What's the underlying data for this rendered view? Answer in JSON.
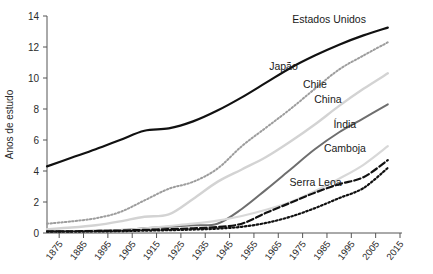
{
  "chart_data": {
    "type": "line",
    "title": "",
    "xlabel": "",
    "ylabel": "Anos de estudo",
    "xlim": [
      1870,
      2015
    ],
    "ylim": [
      0,
      14
    ],
    "yticks": [
      0,
      2,
      4,
      6,
      8,
      10,
      12,
      14
    ],
    "xticks": [
      1875,
      1885,
      1895,
      1905,
      1915,
      1925,
      1935,
      1945,
      1955,
      1965,
      1975,
      1985,
      1995,
      2005,
      2015
    ],
    "grid": false,
    "legend_position": "inline-labels",
    "x": [
      1870,
      1880,
      1890,
      1900,
      1910,
      1920,
      1930,
      1940,
      1950,
      1960,
      1970,
      1980,
      1990,
      2000,
      2010
    ],
    "series": [
      {
        "name": "Estados Unidos",
        "color": "#111111",
        "style": "solid",
        "width": 2.2,
        "label_x": 2001,
        "label_y": 13.55,
        "values": [
          4.3,
          4.85,
          5.4,
          6.0,
          6.6,
          6.75,
          7.2,
          7.9,
          8.75,
          9.7,
          10.65,
          11.45,
          12.15,
          12.75,
          13.25
        ]
      },
      {
        "name": "Japão",
        "color": "#9d9d9d",
        "style": "dotted",
        "width": 2.0,
        "label_x": 1973,
        "label_y": 10.5,
        "values": [
          0.6,
          0.75,
          0.95,
          1.35,
          2.1,
          2.85,
          3.3,
          4.15,
          5.6,
          6.8,
          8.0,
          9.3,
          10.55,
          11.45,
          12.3
        ]
      },
      {
        "name": "Chile",
        "color": "#d3d3d3",
        "style": "solid",
        "width": 2.4,
        "label_x": 1985,
        "label_y": 9.35,
        "values": [
          0.25,
          0.35,
          0.5,
          0.75,
          1.05,
          1.2,
          2.2,
          3.3,
          4.1,
          4.9,
          5.9,
          7.0,
          8.2,
          9.3,
          10.3
        ]
      },
      {
        "name": "China",
        "color": "#6e6e6e",
        "style": "solid",
        "width": 2.0,
        "label_x": 1991,
        "label_y": 8.4,
        "values": [
          0.1,
          0.12,
          0.15,
          0.2,
          0.3,
          0.4,
          0.5,
          0.6,
          1.55,
          2.8,
          4.1,
          5.4,
          6.5,
          7.4,
          8.3
        ]
      },
      {
        "name": "Índia",
        "color": "#d8d8d8",
        "style": "solid",
        "width": 2.2,
        "label_x": 1997,
        "label_y": 6.8,
        "values": [
          0.08,
          0.1,
          0.12,
          0.18,
          0.3,
          0.45,
          0.6,
          0.8,
          1.1,
          1.5,
          2.0,
          2.7,
          3.5,
          4.4,
          5.6
        ]
      },
      {
        "name": "Camboja",
        "color": "#111111",
        "style": "dashed",
        "width": 2.2,
        "label_x": 2001,
        "label_y": 5.25,
        "values": [
          0.1,
          0.11,
          0.13,
          0.16,
          0.2,
          0.25,
          0.3,
          0.38,
          0.6,
          1.3,
          1.95,
          2.6,
          3.15,
          3.6,
          4.7
        ]
      },
      {
        "name": "Serra Leoa",
        "color": "#111111",
        "style": "dotted",
        "width": 2.2,
        "label_x": 1991,
        "label_y": 3.05,
        "values": [
          0.08,
          0.09,
          0.1,
          0.12,
          0.15,
          0.18,
          0.22,
          0.28,
          0.4,
          0.65,
          1.05,
          1.6,
          2.25,
          2.9,
          4.2
        ]
      }
    ]
  }
}
